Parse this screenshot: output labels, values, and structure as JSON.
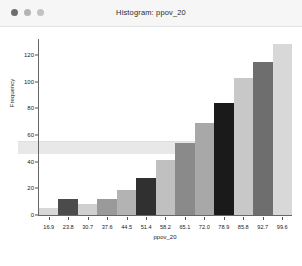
{
  "window": {
    "title": "Histogram: ppov_20",
    "controls": [
      {
        "name": "close",
        "color": "#6d6d6d"
      },
      {
        "name": "minimize",
        "color": "#b4b4b4"
      },
      {
        "name": "maximize",
        "color": "#c2c2c2"
      }
    ]
  },
  "statusbar": {
    "text": ""
  },
  "chart_data": {
    "type": "bar",
    "title": "Histogram: ppov_20",
    "xlabel": "ppov_20",
    "ylabel": "Frequency",
    "grid": false,
    "legend": null,
    "xlim": [
      13.45,
      103.05
    ],
    "ylim": [
      0,
      132
    ],
    "xtick_labels": [
      "16.9",
      "23.8",
      "30.7",
      "37.6",
      "44.5",
      "51.4",
      "58.2",
      "65.1",
      "72.0",
      "78.9",
      "85.8",
      "92.7",
      "99.6"
    ],
    "xtick_values": [
      16.9,
      23.8,
      30.7,
      37.6,
      44.5,
      51.4,
      58.2,
      65.1,
      72.0,
      78.9,
      85.8,
      92.7,
      99.6
    ],
    "ytick_labels": [
      "0",
      "20",
      "40",
      "60",
      "80",
      "100",
      "120"
    ],
    "ytick_values": [
      0,
      20,
      40,
      60,
      80,
      100,
      120
    ],
    "bin_edges": [
      13.45,
      20.35,
      27.25,
      34.15,
      41.05,
      47.95,
      54.85,
      61.75,
      68.65,
      75.55,
      82.45,
      89.35,
      96.25,
      103.05
    ],
    "categories": [
      "16.9",
      "23.8",
      "30.7",
      "37.6",
      "44.5",
      "51.4",
      "58.2",
      "65.1",
      "72.0",
      "78.9",
      "85.8",
      "92.7",
      "99.6"
    ],
    "values": [
      5,
      12,
      8,
      12,
      19,
      28,
      41,
      54,
      69,
      84,
      103,
      115,
      128
    ],
    "bar_colors": [
      "#d8d8d8",
      "#4b4b4b",
      "#d0d0d0",
      "#9a9a9a",
      "#b3b3b3",
      "#303030",
      "#c0c0c0",
      "#8a8a8a",
      "#a8a8a8",
      "#1a1a1a",
      "#c8c8c8",
      "#6e6e6e"
    ]
  }
}
